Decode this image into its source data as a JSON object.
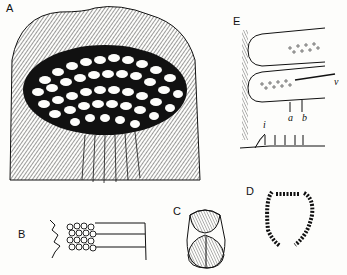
{
  "figure": {
    "panels": [
      {
        "id": "A",
        "label": "A",
        "description": "Surface with polygonal reticulated cell pattern and hatched border"
      },
      {
        "id": "B",
        "label": "B",
        "description": "Serrated structure with two rows of clustered rounded granules"
      },
      {
        "id": "C",
        "label": "C",
        "description": "Capsule-shaped body with dark upper cap and split lower lobes"
      },
      {
        "id": "D",
        "label": "D",
        "description": "Horseshoe-shaped segmented ring in cross-section"
      },
      {
        "id": "E",
        "label": "E",
        "description": "Longitudinal section showing two lobed loops with dotted interior",
        "annotations": [
          "a",
          "b",
          "b",
          "i",
          "v"
        ]
      }
    ],
    "annotation_labels": {
      "a": "a",
      "b": "b",
      "i": "i",
      "v": "v"
    }
  }
}
